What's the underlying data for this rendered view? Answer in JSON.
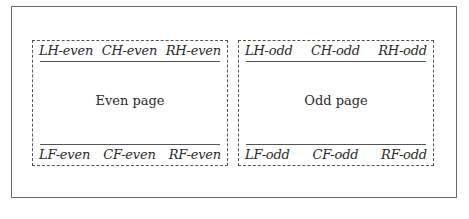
{
  "diagram": {
    "even_page": {
      "label": "Even page",
      "header": {
        "left": "LH-even",
        "center": "CH-even",
        "right": "RH-even"
      },
      "footer": {
        "left": "LF-even",
        "center": "CF-even",
        "right": "RF-even"
      }
    },
    "odd_page": {
      "label": "Odd page",
      "header": {
        "left": "LH-odd",
        "center": "CH-odd",
        "right": "RH-odd"
      },
      "footer": {
        "left": "LF-odd",
        "center": "CF-odd",
        "right": "RF-odd"
      }
    },
    "colors": {
      "frame": "#6a6a6a",
      "dash": "#555555",
      "text": "#2a2a2a"
    }
  }
}
